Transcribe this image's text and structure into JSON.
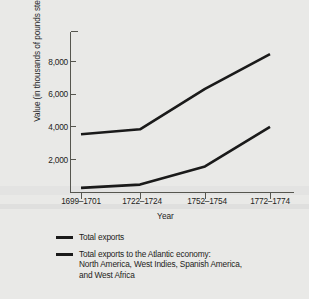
{
  "chart_data": {
    "type": "line",
    "title": "",
    "xlabel": "Year",
    "ylabel": "Value (in thousands of pounds sterling)",
    "categories": [
      "1699–1701",
      "1722–1724",
      "1752–1754",
      "1772–1774"
    ],
    "ylim": [
      0,
      9000
    ],
    "yticks": [
      2000,
      4000,
      6000,
      8000
    ],
    "ytick_labels": [
      "2,000",
      "4,000",
      "6,000",
      "8,000"
    ],
    "grid": false,
    "legend_position": "below",
    "series": [
      {
        "name": "Total exports",
        "color": "#1a1a1a",
        "values": [
          3500,
          3800,
          6250,
          8350
        ]
      },
      {
        "name": "Total exports to the Atlantic economy: North America, West Indies, Spanish America, and West Africa",
        "color": "#1a1a1a",
        "values": [
          250,
          450,
          1550,
          3950
        ]
      }
    ]
  },
  "axis": {
    "y_title": "Value (in thousands of pounds sterling)",
    "x_title": "Year",
    "y_tick_labels": [
      "8,000",
      "6,000",
      "4,000",
      "2,000"
    ],
    "x_tick_labels": [
      "1699–1701",
      "1722–1724",
      "1752–1754",
      "1772–1774"
    ]
  },
  "legend": {
    "items": [
      {
        "lines": [
          "Total exports"
        ]
      },
      {
        "lines": [
          "Total exports to the Atlantic economy:",
          "North America, West Indies, Spanish America,",
          "and West Africa"
        ]
      }
    ]
  },
  "colors": {
    "background": "#e9e9e7",
    "line": "#1a1a1a",
    "axis": "#4a4a46",
    "text": "#1d1d1a"
  }
}
